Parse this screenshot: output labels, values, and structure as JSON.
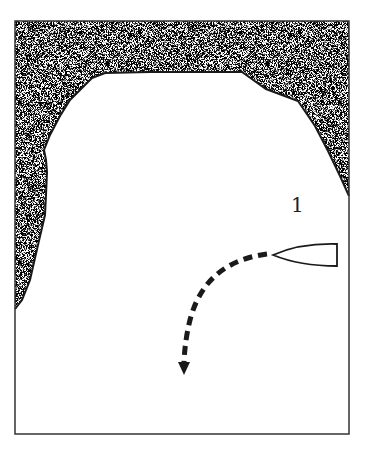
{
  "diagram": {
    "title": "",
    "labels": [
      {
        "id": "position-1",
        "text": "1",
        "x": 291,
        "y": 193
      }
    ],
    "colors": {
      "ink": "#1a1a1a",
      "land_fill": "#9a9a9a",
      "water": "#ffffff"
    },
    "elements": {
      "frame": "rectangular map border",
      "land": "stippled shoreline enclosing bay on three sides",
      "boat": "outline of a boat hull pointing left",
      "path": "dashed curved arrow from boat bow turning downward"
    }
  }
}
